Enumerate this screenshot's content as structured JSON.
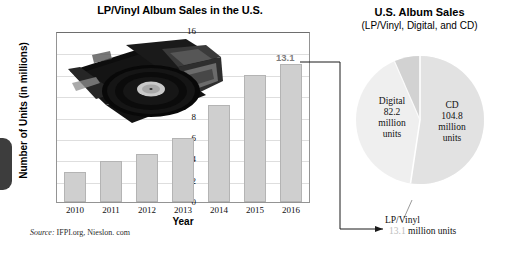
{
  "bar_chart": {
    "title": "LP/Vinyl Album Sales in the U.S.",
    "ylabel": "Number of Units (in millions)",
    "xlabel": "Year",
    "source_prefix": "Source:",
    "source_text": "IFPI.org, Nieslon. com",
    "callout_value": "13.1",
    "photo_name": "vinyl-records-photo"
  },
  "pie_chart": {
    "title": "U.S. Album Sales",
    "subtitle": "(LP/Vinyl, Digital, and CD)",
    "cd": {
      "name": "CD",
      "value": "104.8",
      "unit_1": "million",
      "unit_2": "units"
    },
    "digital": {
      "name": "Digital",
      "value": "82.2",
      "unit_1": "million",
      "unit_2": "units"
    },
    "lp": {
      "name": "LP/Vinyl",
      "value": "13.1",
      "unit": "million units"
    }
  },
  "chart_data": [
    {
      "type": "bar",
      "title": "LP/Vinyl Album Sales in the U.S.",
      "xlabel": "Year",
      "ylabel": "Number of Units (in millions)",
      "categories": [
        "2010",
        "2011",
        "2012",
        "2013",
        "2014",
        "2015",
        "2016"
      ],
      "values": [
        2.8,
        3.9,
        4.5,
        6.1,
        9.2,
        12.0,
        13.1
      ],
      "ylim": [
        0,
        16
      ],
      "yticks": [
        0,
        2,
        4,
        6,
        8,
        10,
        12,
        14,
        16
      ],
      "grid": true,
      "legend": "none",
      "annotations": [
        {
          "text": "13.1",
          "category": "2016",
          "value": 13.1
        }
      ],
      "source": "Source: IFPI.org, Nieslon. com",
      "bar_color": "#cfcfcf"
    },
    {
      "type": "pie",
      "title": "U.S. Album Sales",
      "subtitle": "(LP/Vinyl, Digital, and CD)",
      "labels": [
        "CD",
        "Digital",
        "LP/Vinyl"
      ],
      "values": [
        104.8,
        82.2,
        13.1
      ],
      "unit": "million units",
      "colors": [
        "#e2e2e2",
        "#efefef",
        "#d2d2d2"
      ],
      "legend": "labels-on-slices"
    }
  ]
}
